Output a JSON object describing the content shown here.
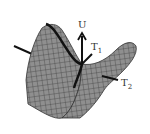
{
  "figure": {
    "labels": {
      "u": "U",
      "t1": "T",
      "t1_sub": "1",
      "t2": "T",
      "t2_sub": "2"
    },
    "colors": {
      "surface": "#8a8a8a",
      "mesh": "#3a3a3a",
      "axis": "#111111"
    }
  }
}
